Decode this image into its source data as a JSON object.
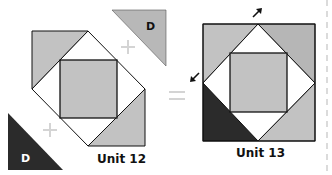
{
  "colors": {
    "light_gray": "#c2c2c2",
    "mid_gray": "#b6b6b6",
    "dark": "#2b2b2b",
    "outline": "#111111",
    "operator": "#d4d4d4",
    "dashed_line": "#cfcfcf",
    "white": "#ffffff"
  },
  "pieces": {
    "top_right_d": {
      "label": "D",
      "shade": "light"
    },
    "bottom_left_d": {
      "label": "D",
      "shade": "dark"
    }
  },
  "operators": {
    "plus_top": "+",
    "plus_bottom": "+",
    "equals": "="
  },
  "units": {
    "unit12": {
      "label": "Unit 12"
    },
    "unit13": {
      "label": "Unit 13"
    }
  },
  "arrows": {
    "top": "arrow-up-right",
    "left": "arrow-down-left"
  }
}
